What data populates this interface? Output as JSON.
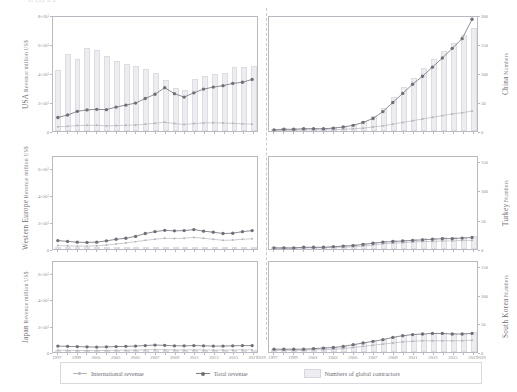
{
  "figure": {
    "top_cutoff_text": "a.  (a)                 a                              a",
    "panel_columns": 2,
    "panel_rows": 3,
    "colors": {
      "bar_fill": "#ececf1",
      "bar_stroke": "#dcdce3",
      "total_revenue_line": "#6f6f78",
      "international_revenue_line": "#b4b4bd",
      "axis": "#b9b9c2",
      "text": "#8b8b90"
    }
  },
  "legend": {
    "items": [
      {
        "label": "International revenue",
        "marker": "line-dot",
        "color": "#b4b4bd"
      },
      {
        "label": "Total revenue",
        "marker": "line-dot",
        "color": "#6f6f78"
      },
      {
        "label": "Numbers of global contractors",
        "marker": "bar",
        "color": "#ececf1"
      }
    ]
  },
  "axis": {
    "x_tick_labels": [
      "1997",
      "1999",
      "2001",
      "2003",
      "2005",
      "2007",
      "2009",
      "2011",
      "2013",
      "2015",
      "2017",
      "2019"
    ],
    "x_years_all": [
      1997,
      1998,
      1999,
      2000,
      2001,
      2002,
      2003,
      2004,
      2005,
      2006,
      2007,
      2008,
      2009,
      2010,
      2011,
      2012,
      2013,
      2014,
      2015,
      2016,
      2017,
      2018
    ],
    "left_axis_title": "Revenue million US$",
    "right_axis_title": "Numbers"
  },
  "chart_data": {
    "type": "line",
    "xlabel": "Year",
    "grid": false,
    "legend_position": "bottom",
    "panels": [
      {
        "row": 0,
        "col": 0,
        "region": "USA",
        "ylabel": "Revenue million US$",
        "ytick_labels": [
          "0",
          "2×10⁵",
          "4×10⁵",
          "6×10⁵",
          "8×10⁵"
        ],
        "ylim": [
          0,
          800000
        ],
        "ytick_values": [
          0,
          200000,
          400000,
          600000,
          800000
        ],
        "bar_axis_label": "Numbers",
        "bar_ylim": [
          0,
          80
        ],
        "x": [
          1997,
          1998,
          1999,
          2000,
          2001,
          2002,
          2003,
          2004,
          2005,
          2006,
          2007,
          2008,
          2009,
          2010,
          2011,
          2012,
          2013,
          2014,
          2015,
          2016,
          2017
        ],
        "series": [
          {
            "name": "Total revenue",
            "values": [
              95000,
              112000,
              138000,
              148000,
              152000,
              150000,
              168000,
              182000,
              196000,
              228000,
              258000,
              304000,
              262000,
              238000,
              268000,
              294000,
              308000,
              318000,
              334000,
              342000,
              362000
            ]
          },
          {
            "name": "International revenue",
            "values": [
              30000,
              33000,
              38000,
              40000,
              40000,
              36000,
              38000,
              40000,
              42000,
              48000,
              54000,
              62000,
              52000,
              46000,
              52000,
              56000,
              58000,
              56000,
              54000,
              50000,
              48000
            ]
          },
          {
            "name": "Numbers of global contractors",
            "values": [
              42,
              53,
              50,
              57,
              56,
              52,
              48,
              46,
              45,
              43,
              40,
              35,
              30,
              28,
              36,
              38,
              39,
              40,
              44,
              44,
              45
            ]
          }
        ]
      },
      {
        "row": 0,
        "col": 1,
        "region": "China",
        "ylabel": "Numbers",
        "ytick_labels": [
          "0",
          "50",
          "100",
          "150",
          "200"
        ],
        "ylim": [
          0,
          200
        ],
        "ytick_values": [
          0,
          50,
          100,
          150,
          200
        ],
        "x": [
          1997,
          1998,
          1999,
          2000,
          2001,
          2002,
          2003,
          2004,
          2005,
          2006,
          2007,
          2008,
          2009,
          2010,
          2011,
          2012,
          2013,
          2014,
          2015,
          2016,
          2017
        ],
        "series": [
          {
            "name": "Numbers of global contractors",
            "values": [
              4,
              5,
              5,
              6,
              6,
              6,
              7,
              9,
              12,
              18,
              26,
              40,
              58,
              76,
              92,
              108,
              124,
              138,
              152,
              165,
              178
            ]
          },
          {
            "name": "Total revenue",
            "values": [
              2,
              3,
              3,
              4,
              4,
              4,
              5,
              7,
              10,
              15,
              22,
              34,
              50,
              66,
              82,
              96,
              112,
              128,
              145,
              162,
              196
            ]
          },
          {
            "name": "International revenue",
            "values": [
              1,
              1,
              1,
              2,
              2,
              2,
              2,
              3,
              4,
              5,
              7,
              9,
              12,
              15,
              18,
              21,
              24,
              27,
              30,
              32,
              35
            ]
          }
        ]
      },
      {
        "row": 1,
        "col": 0,
        "region": "Western Europe",
        "ylabel": "Revenue million US$",
        "ytick_labels": [
          "0",
          "2×10⁵",
          "4×10⁵",
          "6×10⁵"
        ],
        "ylim": [
          0,
          700000
        ],
        "ytick_values": [
          0,
          200000,
          400000,
          600000
        ],
        "x": [
          1997,
          1998,
          1999,
          2000,
          2001,
          2002,
          2003,
          2004,
          2005,
          2006,
          2007,
          2008,
          2009,
          2010,
          2011,
          2012,
          2013,
          2014,
          2015,
          2016,
          2017
        ],
        "series": [
          {
            "name": "Total revenue",
            "values": [
              64000,
              58000,
              52000,
              50000,
              52000,
              62000,
              74000,
              82000,
              96000,
              118000,
              132000,
              142000,
              138000,
              140000,
              148000,
              136000,
              128000,
              118000,
              120000,
              132000,
              140000
            ]
          },
          {
            "name": "International revenue",
            "values": [
              26000,
              24000,
              22000,
              22000,
              24000,
              30000,
              38000,
              46000,
              56000,
              66000,
              74000,
              82000,
              80000,
              82000,
              88000,
              82000,
              74000,
              66000,
              68000,
              74000,
              78000
            ]
          },
          {
            "name": "Numbers of global contractors",
            "values": [
              14,
              14,
              13,
              13,
              13,
              14,
              15,
              15,
              16,
              16,
              16,
              15,
              15,
              15,
              15,
              14,
              14,
              13,
              13,
              13,
              13
            ]
          }
        ]
      },
      {
        "row": 1,
        "col": 1,
        "region": "Turkey",
        "ylabel": "Numbers",
        "ytick_labels": [
          "0",
          "50",
          "100",
          "150"
        ],
        "ylim": [
          0,
          160
        ],
        "ytick_values": [
          0,
          50,
          100,
          150
        ],
        "x": [
          1997,
          1998,
          1999,
          2000,
          2001,
          2002,
          2003,
          2004,
          2005,
          2006,
          2007,
          2008,
          2009,
          2010,
          2011,
          2012,
          2013,
          2014,
          2015,
          2016,
          2017
        ],
        "series": [
          {
            "name": "Total revenue",
            "values": [
              2,
              2,
              2,
              3,
              3,
              3,
              4,
              5,
              6,
              8,
              10,
              12,
              13,
              14,
              15,
              16,
              17,
              18,
              18,
              19,
              20
            ]
          },
          {
            "name": "International revenue",
            "values": [
              1,
              1,
              1,
              2,
              2,
              2,
              3,
              3,
              4,
              5,
              7,
              9,
              10,
              11,
              12,
              13,
              13,
              14,
              14,
              15,
              15
            ]
          },
          {
            "name": "Numbers of global contractors",
            "values": [
              2,
              2,
              2,
              3,
              3,
              4,
              5,
              6,
              8,
              10,
              12,
              14,
              15,
              16,
              17,
              18,
              19,
              20,
              20,
              21,
              22
            ]
          }
        ]
      },
      {
        "row": 2,
        "col": 0,
        "region": "Japan",
        "ylabel": "Revenue million US$",
        "ytick_labels": [
          "0",
          "2×10⁵",
          "4×10⁵",
          "6×10⁵"
        ],
        "ylim": [
          0,
          700000
        ],
        "ytick_values": [
          0,
          200000,
          400000,
          600000
        ],
        "x": [
          1997,
          1998,
          1999,
          2000,
          2001,
          2002,
          2003,
          2004,
          2005,
          2006,
          2007,
          2008,
          2009,
          2010,
          2011,
          2012,
          2013,
          2014,
          2015,
          2016,
          2017
        ],
        "series": [
          {
            "name": "Total revenue",
            "values": [
              46000,
              44000,
              42000,
              40000,
              38000,
              40000,
              42000,
              44000,
              46000,
              50000,
              54000,
              52000,
              48000,
              48000,
              50000,
              48000,
              46000,
              46000,
              48000,
              50000,
              50000
            ]
          },
          {
            "name": "International revenue",
            "values": [
              14000,
              13000,
              12000,
              11000,
              11000,
              12000,
              13000,
              14000,
              15000,
              17000,
              19000,
              18000,
              16000,
              16000,
              17000,
              16000,
              15000,
              15000,
              16000,
              17000,
              17000
            ]
          },
          {
            "name": "Numbers of global contractors",
            "values": [
              12,
              12,
              12,
              11,
              11,
              11,
              11,
              11,
              11,
              11,
              11,
              10,
              10,
              10,
              10,
              9,
              9,
              9,
              9,
              9,
              9
            ]
          }
        ]
      },
      {
        "row": 2,
        "col": 1,
        "region": "South Korea",
        "ylabel": "Numbers",
        "ytick_labels": [
          "0",
          "50",
          "100",
          "150"
        ],
        "ylim": [
          0,
          160
        ],
        "ytick_values": [
          0,
          50,
          100,
          150
        ],
        "x": [
          1997,
          1998,
          1999,
          2000,
          2001,
          2002,
          2003,
          2004,
          2005,
          2006,
          2007,
          2008,
          2009,
          2010,
          2011,
          2012,
          2013,
          2014,
          2015,
          2016,
          2017
        ],
        "series": [
          {
            "name": "Total revenue",
            "values": [
              5,
              5,
              5,
              5,
              6,
              7,
              8,
              10,
              13,
              16,
              19,
              22,
              26,
              29,
              31,
              32,
              33,
              33,
              32,
              32,
              33
            ]
          },
          {
            "name": "International revenue",
            "values": [
              3,
              3,
              3,
              3,
              4,
              4,
              5,
              6,
              8,
              10,
              12,
              14,
              16,
              18,
              19,
              20,
              20,
              20,
              20,
              20,
              21
            ]
          },
          {
            "name": "Numbers of global contractors",
            "values": [
              6,
              6,
              6,
              6,
              7,
              8,
              9,
              11,
              14,
              17,
              20,
              23,
              26,
              29,
              31,
              32,
              33,
              33,
              33,
              33,
              34
            ]
          }
        ]
      }
    ]
  }
}
